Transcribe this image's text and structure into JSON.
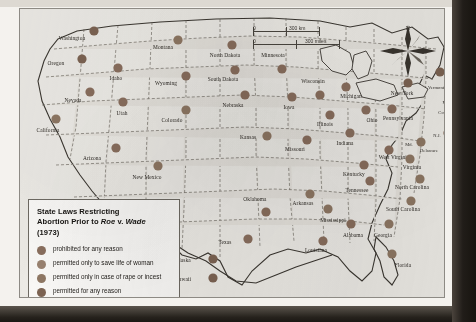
{
  "legend": {
    "title_parts": {
      "line1": "State Laws Restricting",
      "line2a": "Abortion Prior to ",
      "line2_roe": "Roe",
      "line2b": " v. ",
      "line2_wade": "Wade",
      "line3": "(1973)"
    },
    "title_full": "State Laws Restricting Abortion Prior to Roe v. Wade (1973)",
    "items": [
      {
        "label": "prohibited for any reason",
        "color": "#8a6f5e"
      },
      {
        "label": "permitted only to save life of woman",
        "color": "#9a8371"
      },
      {
        "label": "permitted only in case of rape or incest",
        "color": "#8f7864"
      },
      {
        "label": "permitted for any reason",
        "color": "#7d6453"
      }
    ]
  },
  "scale": {
    "km": {
      "zero": "0",
      "value": "300 km"
    },
    "miles": {
      "zero": "0",
      "value": "300 miles"
    }
  },
  "compass": {
    "north_label": "N"
  },
  "chart_data": {
    "type": "map",
    "title": "State Laws Restricting Abortion Prior to Roe v. Wade (1973)",
    "projection": "conterminous United States with Alaska and Hawaii insets",
    "categories": [
      "prohibited for any reason",
      "permitted only to save life of woman",
      "permitted only in case of rape or incest",
      "permitted for any reason"
    ],
    "states": [
      {
        "name": "Washington",
        "lx": 52,
        "ly": 31,
        "dx": 74,
        "dy": 22,
        "category": "permitted for any reason"
      },
      {
        "name": "Oregon",
        "lx": 36,
        "ly": 56,
        "dx": 62,
        "dy": 50,
        "category": "permitted for any reason"
      },
      {
        "name": "Idaho",
        "lx": 96,
        "ly": 71,
        "dx": 98,
        "dy": 59,
        "category": "prohibited for any reason"
      },
      {
        "name": "Montana",
        "lx": 143,
        "ly": 40,
        "dx": 158,
        "dy": 31,
        "category": "permitted only in case of rape or incest"
      },
      {
        "name": "Nevada",
        "lx": 53,
        "ly": 93,
        "dx": 70,
        "dy": 83,
        "category": "prohibited for any reason"
      },
      {
        "name": "Utah",
        "lx": 102,
        "ly": 106,
        "dx": 103,
        "dy": 93,
        "category": "prohibited for any reason"
      },
      {
        "name": "Wyoming",
        "lx": 146,
        "ly": 76,
        "dx": 166,
        "dy": 67,
        "category": "prohibited for any reason"
      },
      {
        "name": "California",
        "lx": 28,
        "ly": 123,
        "dx": 36,
        "dy": 110,
        "category": "permitted only in case of rape or incest"
      },
      {
        "name": "Colorado",
        "lx": 152,
        "ly": 113,
        "dx": 166,
        "dy": 101,
        "category": "permitted only in case of rape or incest"
      },
      {
        "name": "Arizona",
        "lx": 72,
        "ly": 151,
        "dx": 96,
        "dy": 139,
        "category": "prohibited for any reason"
      },
      {
        "name": "New Mexico",
        "lx": 127,
        "ly": 170,
        "dx": 138,
        "dy": 157,
        "category": "permitted only in case of rape or incest"
      },
      {
        "name": "North Dakota",
        "lx": 205,
        "ly": 48,
        "dx": 212,
        "dy": 36,
        "category": "prohibited for any reason"
      },
      {
        "name": "South Dakota",
        "lx": 203,
        "ly": 72,
        "dx": 215,
        "dy": 61,
        "category": "prohibited for any reason"
      },
      {
        "name": "Nebraska",
        "lx": 213,
        "ly": 98,
        "dx": 225,
        "dy": 86,
        "category": "prohibited for any reason"
      },
      {
        "name": "Kansas",
        "lx": 228,
        "ly": 130,
        "dx": 247,
        "dy": 127,
        "category": "permitted only in case of rape or incest"
      },
      {
        "name": "Minnesota",
        "lx": 253,
        "ly": 48,
        "dx": 262,
        "dy": 60,
        "category": "prohibited for any reason"
      },
      {
        "name": "Iowa",
        "lx": 269,
        "ly": 100,
        "dx": 272,
        "dy": 88,
        "category": "prohibited for any reason"
      },
      {
        "name": "Missouri",
        "lx": 275,
        "ly": 142,
        "dx": 287,
        "dy": 131,
        "category": "prohibited for any reason"
      },
      {
        "name": "Wisconsin",
        "lx": 293,
        "ly": 74,
        "dx": 300,
        "dy": 86,
        "category": "prohibited for any reason"
      },
      {
        "name": "Illinois",
        "lx": 305,
        "ly": 117,
        "dx": 310,
        "dy": 106,
        "category": "prohibited for any reason"
      },
      {
        "name": "Michigan",
        "lx": 331,
        "ly": 89,
        "dx": 326,
        "dy": 78,
        "category": "prohibited for any reason"
      },
      {
        "name": "Indiana",
        "lx": 325,
        "ly": 136,
        "dx": 330,
        "dy": 124,
        "category": "prohibited for any reason"
      },
      {
        "name": "Ohio",
        "lx": 352,
        "ly": 113,
        "dx": 346,
        "dy": 101,
        "category": "prohibited for any reason"
      },
      {
        "name": "Kentucky",
        "lx": 334,
        "ly": 167,
        "dx": 344,
        "dy": 156,
        "category": "prohibited for any reason"
      },
      {
        "name": "Tennessee",
        "lx": 337,
        "ly": 183,
        "dx": 350,
        "dy": 172,
        "category": "prohibited for any reason"
      },
      {
        "name": "Pennsylvania",
        "lx": 378,
        "ly": 111,
        "dx": 372,
        "dy": 100,
        "category": "prohibited for any reason"
      },
      {
        "name": "New York",
        "lx": 382,
        "ly": 86,
        "dx": 388,
        "dy": 74,
        "category": "permitted for any reason"
      },
      {
        "name": "Vermont",
        "lx": 416,
        "ly": 80,
        "dx": 420,
        "dy": 63,
        "category": "permitted for any reason"
      },
      {
        "name": "N.H.",
        "lx": 429,
        "ly": 77,
        "dx": 433,
        "dy": 62,
        "category": "permitted for any reason"
      },
      {
        "name": "Maine",
        "lx": 440,
        "ly": 58,
        "dx": 442,
        "dy": 45,
        "category": "permitted only in case of rape or incest"
      },
      {
        "name": "Mass.",
        "lx": 428,
        "ly": 95,
        "dx": 438,
        "dy": 88,
        "category": "prohibited for any reason"
      },
      {
        "name": "Conn.",
        "lx": 424,
        "ly": 105,
        "dx": 433,
        "dy": 100,
        "category": "prohibited for any reason"
      },
      {
        "name": "R.I.",
        "lx": 437,
        "ly": 108,
        "dx": 446,
        "dy": 104,
        "category": "prohibited for any reason"
      },
      {
        "name": "N.J.",
        "lx": 417,
        "ly": 128,
        "dx": 428,
        "dy": 124,
        "category": "prohibited for any reason"
      },
      {
        "name": "Delaware",
        "lx": 409,
        "ly": 143,
        "dx": 431,
        "dy": 140,
        "category": "permitted only in case of rape or incest"
      },
      {
        "name": "Md.",
        "lx": 389,
        "ly": 137,
        "dx": 401,
        "dy": 133,
        "category": "permitted only in case of rape or incest"
      },
      {
        "name": "West Virginia",
        "lx": 374,
        "ly": 150,
        "dx": 369,
        "dy": 141,
        "category": "prohibited for any reason"
      },
      {
        "name": "Virginia",
        "lx": 392,
        "ly": 160,
        "dx": 390,
        "dy": 150,
        "category": "permitted only in case of rape or incest"
      },
      {
        "name": "North Carolina",
        "lx": 392,
        "ly": 180,
        "dx": 400,
        "dy": 170,
        "category": "permitted only in case of rape or incest"
      },
      {
        "name": "South Carolina",
        "lx": 383,
        "ly": 202,
        "dx": 391,
        "dy": 192,
        "category": "permitted only in case of rape or incest"
      },
      {
        "name": "Georgia",
        "lx": 363,
        "ly": 228,
        "dx": 369,
        "dy": 215,
        "category": "permitted only in case of rape or incest"
      },
      {
        "name": "Alabama",
        "lx": 333,
        "ly": 228,
        "dx": 331,
        "dy": 215,
        "category": "prohibited for any reason"
      },
      {
        "name": "Mississippi",
        "lx": 313,
        "ly": 213,
        "dx": 308,
        "dy": 200,
        "category": "permitted only in case of rape or incest"
      },
      {
        "name": "Arkansas",
        "lx": 283,
        "ly": 196,
        "dx": 290,
        "dy": 185,
        "category": "permitted only in case of rape or incest"
      },
      {
        "name": "Louisiana",
        "lx": 296,
        "ly": 243,
        "dx": 303,
        "dy": 232,
        "category": "prohibited for any reason"
      },
      {
        "name": "Oklahoma",
        "lx": 235,
        "ly": 192,
        "dx": 246,
        "dy": 203,
        "category": "prohibited for any reason"
      },
      {
        "name": "Texas",
        "lx": 205,
        "ly": 235,
        "dx": 228,
        "dy": 230,
        "category": "prohibited for any reason"
      },
      {
        "name": "Florida",
        "lx": 383,
        "ly": 258,
        "dx": 372,
        "dy": 245,
        "category": "permitted only in case of rape or incest"
      },
      {
        "name": "Alaska",
        "lx": 163,
        "ly": 253,
        "dx": 193,
        "dy": 250,
        "category": "permitted for any reason"
      },
      {
        "name": "Hawaii",
        "lx": 163,
        "ly": 272,
        "dx": 193,
        "dy": 269,
        "category": "permitted for any reason"
      }
    ]
  }
}
